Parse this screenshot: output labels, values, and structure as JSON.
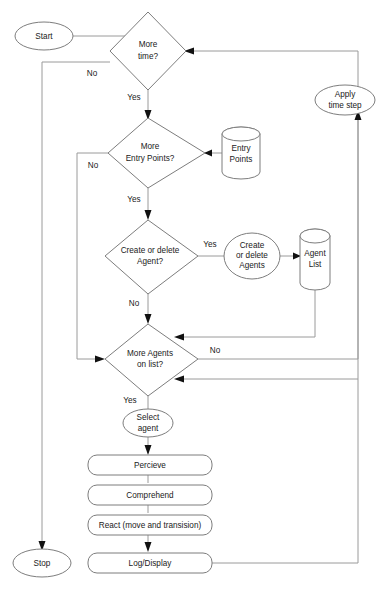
{
  "diagram": {
    "type": "flowchart",
    "colors": {
      "background": "#ffffff",
      "shape_stroke": "#7d7d7d",
      "edge_stroke": "#9a9a9a",
      "arrow_fill": "#111111",
      "text": "#1a1a1a"
    }
  },
  "nodes": {
    "start": {
      "label": "Start",
      "shape": "ellipse"
    },
    "stop": {
      "label": "Stop",
      "shape": "ellipse"
    },
    "more_time": {
      "label_line1": "More",
      "label_line2": "time?",
      "shape": "diamond"
    },
    "more_entry_points": {
      "label_line1": "More",
      "label_line2": "Entry Points?",
      "shape": "diamond"
    },
    "create_or_delete_agent": {
      "label_line1": "Create or delete",
      "label_line2": "Agent?",
      "shape": "diamond"
    },
    "more_agents_on_list": {
      "label_line1": "More Agents",
      "label_line2": "on list?",
      "shape": "diamond"
    },
    "apply_time_step": {
      "label_line1": "Apply",
      "label_line2": "time step",
      "shape": "ellipse"
    },
    "entry_points_store": {
      "label_line1": "Entry",
      "label_line2": "Points",
      "shape": "cylinder"
    },
    "agent_list_store": {
      "label_line1": "Agent",
      "label_line2": "List",
      "shape": "cylinder"
    },
    "create_or_delete_agents": {
      "label_line1": "Create",
      "label_line2": "or delete",
      "label_line3": "Agents",
      "shape": "circle"
    },
    "select_agent": {
      "label_line1": "Select",
      "label_line2": "agent",
      "shape": "ellipse"
    },
    "percieve": {
      "label": "Percieve",
      "shape": "rounded-rect"
    },
    "comprehend": {
      "label": "Comprehend",
      "shape": "rounded-rect"
    },
    "react": {
      "label": "React (move and transision)",
      "shape": "rounded-rect"
    },
    "log_display": {
      "label": "Log/Display",
      "shape": "rounded-rect"
    }
  },
  "edge_labels": {
    "more_time_no": "No",
    "more_time_yes": "Yes",
    "more_entry_points_no": "No",
    "more_entry_points_yes": "Yes",
    "create_agent_yes": "Yes",
    "create_agent_no": "No",
    "more_agents_no": "No",
    "more_agents_yes": "Yes"
  }
}
